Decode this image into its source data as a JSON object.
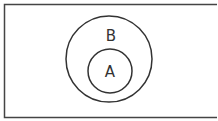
{
  "diagram": {
    "type": "venn-subset",
    "universe": {
      "label": ""
    },
    "sets": [
      {
        "id": "B",
        "label": "B",
        "contains": [
          "A"
        ]
      },
      {
        "id": "A",
        "label": "A"
      }
    ],
    "colors": {
      "stroke": "#333333",
      "background": "#ffffff"
    }
  }
}
